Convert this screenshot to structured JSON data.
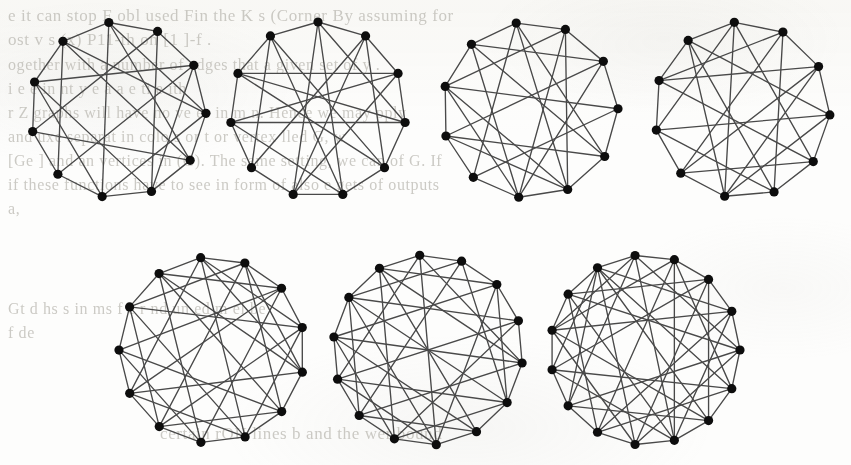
{
  "page": {
    "width": 851,
    "height": 465,
    "background_color": "#fdfdfc",
    "kind": "scanned-book-figure"
  },
  "ink": {
    "edge_color": "#4b4b4b",
    "vertex_color": "#111111",
    "ghost_text_color": "#b9b7b0"
  },
  "ghost_text": {
    "note": "Faint mirrored bleed-through from the reverse side of the sheet; only partially legible.",
    "lines": [
      {
        "text": "e it can stop F   obl used Fin  the K   s   (Corner   By assuming for",
        "x": 8,
        "y": 6,
        "size": 17,
        "mirrored": false
      },
      {
        "text": "ost  v  s  (x)  P11-th  on [1 ]-f .",
        "x": 8,
        "y": 30,
        "size": 17,
        "mirrored": false
      },
      {
        "text": "ogether with a number of edges      that a given set of   y     .",
        "x": 8,
        "y": 56,
        "size": 16,
        "mirrored": false
      },
      {
        "text": "i    e       e   in  nt   y   e   a    a   e    ti   e       ith",
        "x": 8,
        "y": 80,
        "size": 16,
        "mirrored": false
      },
      {
        "text": "r  Z   graphs will have no ve   es in   m    n. Hence we may  pply",
        "x": 8,
        "y": 104,
        "size": 16,
        "mirrored": false
      },
      {
        "text": "and  uxe separat  in  colo  s  or t   or vertex   lled G, w",
        "x": 8,
        "y": 128,
        "size": 16,
        "mirrored": false
      },
      {
        "text": "[Ge   ] and an vertices in (G). The same setting, we can of G. If",
        "x": 8,
        "y": 152,
        "size": 16,
        "mirrored": false
      },
      {
        "text": "if these functions have to see in form of also     e   gets  of  outputs",
        "x": 8,
        "y": 176,
        "size": 16,
        "mirrored": false
      },
      {
        "text": "a,",
        "x": 8,
        "y": 200,
        "size": 16,
        "mirrored": false
      },
      {
        "text": "Gt   d   hs       s in  ms   f   e  r    nd     un  ed  m   el   be",
        "x": 8,
        "y": 300,
        "size": 16,
        "mirrored": false
      },
      {
        "text": "f   de",
        "x": 8,
        "y": 324,
        "size": 16,
        "mirrored": false
      },
      {
        "text": "certain rOH lines b and  the  wer bound",
        "x": 160,
        "y": 424,
        "size": 17,
        "mirrored": false
      }
    ]
  },
  "figure": {
    "name": "seven-graph-drawings",
    "rows": 2,
    "panels_top": 4,
    "panels_bottom": 3,
    "layout_style": "vertices on a circle, straight-line chords"
  },
  "graphs": [
    {
      "id": "graph-1",
      "row": "top",
      "index": 1,
      "cx": 118,
      "cy": 110,
      "r": 88,
      "rot": -96,
      "n": 11,
      "vertex_radius": 4.6,
      "edges": [
        [
          0,
          1
        ],
        [
          1,
          2
        ],
        [
          2,
          3
        ],
        [
          3,
          4
        ],
        [
          4,
          5
        ],
        [
          5,
          6
        ],
        [
          6,
          7
        ],
        [
          7,
          8
        ],
        [
          8,
          9
        ],
        [
          9,
          10
        ],
        [
          10,
          0
        ],
        [
          0,
          4
        ],
        [
          0,
          6
        ],
        [
          1,
          5
        ],
        [
          1,
          8
        ],
        [
          2,
          7
        ],
        [
          2,
          9
        ],
        [
          3,
          6
        ],
        [
          3,
          10
        ],
        [
          4,
          8
        ],
        [
          5,
          9
        ],
        [
          0,
          3
        ],
        [
          6,
          9
        ],
        [
          7,
          10
        ],
        [
          4,
          10
        ],
        [
          2,
          5
        ]
      ]
    },
    {
      "id": "graph-2",
      "row": "top",
      "index": 2,
      "cx": 318,
      "cy": 110,
      "r": 88,
      "rot": -90,
      "n": 11,
      "vertex_radius": 4.6,
      "edges": [
        [
          0,
          1
        ],
        [
          1,
          2
        ],
        [
          2,
          3
        ],
        [
          3,
          4
        ],
        [
          4,
          5
        ],
        [
          5,
          6
        ],
        [
          6,
          7
        ],
        [
          7,
          8
        ],
        [
          8,
          9
        ],
        [
          9,
          10
        ],
        [
          10,
          0
        ],
        [
          0,
          5
        ],
        [
          0,
          6
        ],
        [
          0,
          3
        ],
        [
          1,
          6
        ],
        [
          1,
          4
        ],
        [
          2,
          8
        ],
        [
          2,
          6
        ],
        [
          3,
          8
        ],
        [
          3,
          9
        ],
        [
          4,
          9
        ],
        [
          4,
          10
        ],
        [
          5,
          10
        ],
        [
          5,
          8
        ],
        [
          7,
          10
        ],
        [
          2,
          9
        ],
        [
          1,
          7
        ]
      ]
    },
    {
      "id": "graph-3",
      "row": "top",
      "index": 3,
      "cx": 530,
      "cy": 110,
      "r": 88,
      "rot": -99,
      "n": 11,
      "vertex_radius": 4.6,
      "edges": [
        [
          0,
          1
        ],
        [
          1,
          2
        ],
        [
          2,
          3
        ],
        [
          3,
          4
        ],
        [
          4,
          5
        ],
        [
          5,
          6
        ],
        [
          6,
          7
        ],
        [
          7,
          8
        ],
        [
          8,
          9
        ],
        [
          9,
          10
        ],
        [
          10,
          0
        ],
        [
          0,
          4
        ],
        [
          0,
          7
        ],
        [
          1,
          5
        ],
        [
          1,
          9
        ],
        [
          2,
          6
        ],
        [
          2,
          10
        ],
        [
          3,
          7
        ],
        [
          3,
          9
        ],
        [
          4,
          8
        ],
        [
          4,
          10
        ],
        [
          5,
          9
        ],
        [
          5,
          8
        ],
        [
          6,
          10
        ],
        [
          6,
          9
        ],
        [
          0,
          5
        ],
        [
          2,
          8
        ],
        [
          1,
          6
        ]
      ]
    },
    {
      "id": "graph-4",
      "row": "top",
      "index": 4,
      "cx": 742,
      "cy": 110,
      "r": 88,
      "rot": -95,
      "n": 11,
      "vertex_radius": 4.6,
      "edges": [
        [
          0,
          1
        ],
        [
          1,
          2
        ],
        [
          2,
          3
        ],
        [
          3,
          4
        ],
        [
          4,
          5
        ],
        [
          5,
          6
        ],
        [
          6,
          7
        ],
        [
          7,
          8
        ],
        [
          8,
          9
        ],
        [
          9,
          10
        ],
        [
          10,
          0
        ],
        [
          0,
          4
        ],
        [
          0,
          6
        ],
        [
          0,
          8
        ],
        [
          1,
          5
        ],
        [
          1,
          7
        ],
        [
          1,
          9
        ],
        [
          2,
          6
        ],
        [
          2,
          9
        ],
        [
          3,
          8
        ],
        [
          3,
          10
        ],
        [
          4,
          9
        ],
        [
          4,
          7
        ],
        [
          5,
          10
        ],
        [
          5,
          8
        ],
        [
          6,
          10
        ],
        [
          2,
          7
        ],
        [
          3,
          6
        ]
      ]
    },
    {
      "id": "graph-5",
      "row": "bottom",
      "index": 5,
      "cx": 212,
      "cy": 350,
      "r": 93,
      "rot": -97,
      "n": 13,
      "vertex_radius": 4.6,
      "edges": [
        [
          0,
          1
        ],
        [
          1,
          2
        ],
        [
          2,
          3
        ],
        [
          3,
          4
        ],
        [
          4,
          5
        ],
        [
          5,
          6
        ],
        [
          6,
          7
        ],
        [
          7,
          8
        ],
        [
          8,
          9
        ],
        [
          9,
          10
        ],
        [
          10,
          11
        ],
        [
          11,
          12
        ],
        [
          12,
          0
        ],
        [
          0,
          4
        ],
        [
          0,
          6
        ],
        [
          0,
          9
        ],
        [
          1,
          5
        ],
        [
          1,
          8
        ],
        [
          1,
          11
        ],
        [
          2,
          7
        ],
        [
          2,
          10
        ],
        [
          2,
          12
        ],
        [
          3,
          8
        ],
        [
          3,
          11
        ],
        [
          4,
          9
        ],
        [
          4,
          12
        ],
        [
          5,
          10
        ],
        [
          5,
          8
        ],
        [
          6,
          11
        ],
        [
          6,
          9
        ],
        [
          7,
          12
        ],
        [
          7,
          10
        ],
        [
          3,
          6
        ],
        [
          1,
          4
        ],
        [
          8,
          11
        ],
        [
          0,
          3
        ],
        [
          5,
          12
        ],
        [
          2,
          9
        ]
      ]
    },
    {
      "id": "graph-6",
      "row": "bottom",
      "index": 6,
      "cx": 428,
      "cy": 350,
      "r": 95,
      "rot": -95,
      "n": 14,
      "vertex_radius": 4.6,
      "edges": [
        [
          0,
          1
        ],
        [
          1,
          2
        ],
        [
          2,
          3
        ],
        [
          3,
          4
        ],
        [
          4,
          5
        ],
        [
          5,
          6
        ],
        [
          6,
          7
        ],
        [
          7,
          8
        ],
        [
          8,
          9
        ],
        [
          9,
          10
        ],
        [
          10,
          11
        ],
        [
          11,
          12
        ],
        [
          12,
          13
        ],
        [
          13,
          0
        ],
        [
          0,
          4
        ],
        [
          0,
          7
        ],
        [
          0,
          10
        ],
        [
          1,
          5
        ],
        [
          1,
          9
        ],
        [
          1,
          12
        ],
        [
          2,
          7
        ],
        [
          2,
          11
        ],
        [
          2,
          13
        ],
        [
          3,
          8
        ],
        [
          3,
          12
        ],
        [
          3,
          10
        ],
        [
          4,
          9
        ],
        [
          4,
          13
        ],
        [
          4,
          11
        ],
        [
          5,
          10
        ],
        [
          5,
          12
        ],
        [
          6,
          11
        ],
        [
          6,
          13
        ],
        [
          6,
          9
        ],
        [
          7,
          12
        ],
        [
          7,
          10
        ],
        [
          8,
          13
        ],
        [
          8,
          11
        ],
        [
          5,
          8
        ],
        [
          2,
          5
        ],
        [
          9,
          12
        ]
      ]
    },
    {
      "id": "graph-7",
      "row": "bottom",
      "index": 7,
      "cx": 645,
      "cy": 350,
      "r": 95,
      "rot": -96,
      "n": 15,
      "vertex_radius": 4.6,
      "edges": [
        [
          0,
          1
        ],
        [
          1,
          2
        ],
        [
          2,
          3
        ],
        [
          3,
          4
        ],
        [
          4,
          5
        ],
        [
          5,
          6
        ],
        [
          6,
          7
        ],
        [
          7,
          8
        ],
        [
          8,
          9
        ],
        [
          9,
          10
        ],
        [
          10,
          11
        ],
        [
          11,
          12
        ],
        [
          12,
          13
        ],
        [
          13,
          14
        ],
        [
          14,
          0
        ],
        [
          0,
          4
        ],
        [
          0,
          7
        ],
        [
          0,
          10
        ],
        [
          0,
          12
        ],
        [
          1,
          5
        ],
        [
          1,
          9
        ],
        [
          1,
          12
        ],
        [
          1,
          7
        ],
        [
          2,
          8
        ],
        [
          2,
          11
        ],
        [
          2,
          13
        ],
        [
          2,
          6
        ],
        [
          3,
          9
        ],
        [
          3,
          12
        ],
        [
          3,
          7
        ],
        [
          3,
          14
        ],
        [
          4,
          10
        ],
        [
          4,
          13
        ],
        [
          4,
          8
        ],
        [
          5,
          11
        ],
        [
          5,
          14
        ],
        [
          5,
          9
        ],
        [
          6,
          12
        ],
        [
          6,
          10
        ],
        [
          7,
          13
        ],
        [
          7,
          11
        ],
        [
          8,
          14
        ],
        [
          8,
          12
        ],
        [
          9,
          13
        ],
        [
          10,
          14
        ],
        [
          6,
          14
        ],
        [
          11,
          14
        ]
      ]
    }
  ]
}
